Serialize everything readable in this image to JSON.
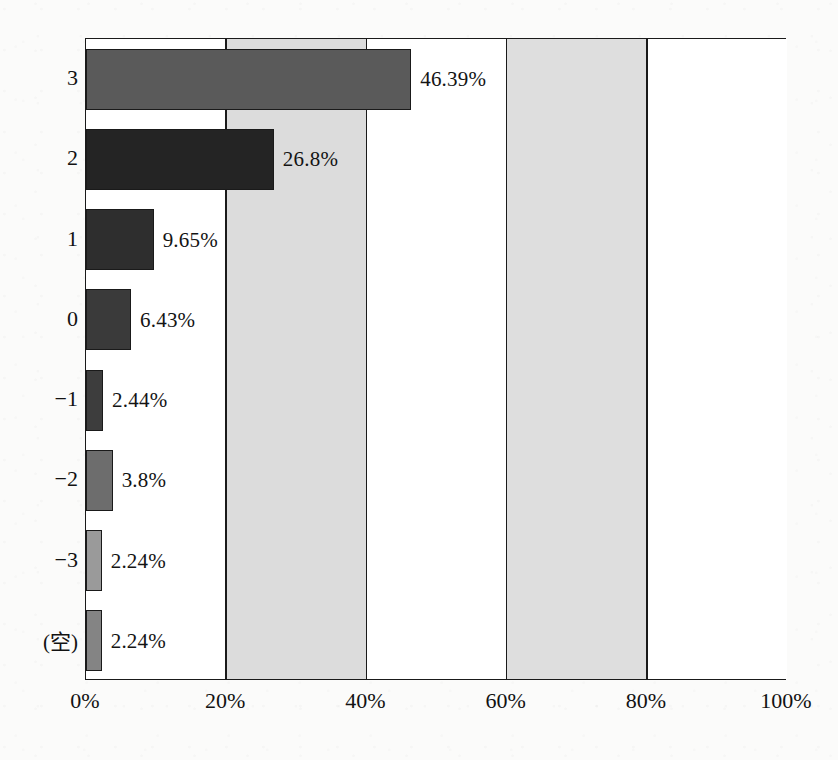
{
  "chart_data": {
    "type": "bar",
    "orientation": "horizontal",
    "title": "",
    "xlabel": "",
    "ylabel": "",
    "categories": [
      "3",
      "2",
      "1",
      "0",
      "−1",
      "−2",
      "−3",
      "(空)"
    ],
    "values": [
      46.39,
      26.8,
      9.65,
      6.43,
      2.44,
      3.8,
      2.24,
      2.24
    ],
    "value_labels": [
      "46.39%",
      "26.8%",
      "9.65%",
      "6.43%",
      "2.44%",
      "3.8%",
      "2.24%",
      "2.24%"
    ],
    "bar_colors": [
      "#5a5a5a",
      "#242424",
      "#2e2e2e",
      "#3a3a3a",
      "#3d3d3d",
      "#6d6d6d",
      "#9a9a9a",
      "#848484"
    ],
    "xlim": [
      0,
      100
    ],
    "xticks": [
      0,
      20,
      40,
      60,
      80,
      100
    ],
    "xtick_labels": [
      "0%",
      "20%",
      "40%",
      "60%",
      "80%",
      "100%"
    ],
    "grid": true,
    "legend": "none",
    "band_shading": [
      "#ffffff",
      "#dcdcdc",
      "#ffffff",
      "#dedede",
      "#ffffff"
    ],
    "axis_color": "#1a1a1a",
    "plot_background": "#ffffff"
  }
}
